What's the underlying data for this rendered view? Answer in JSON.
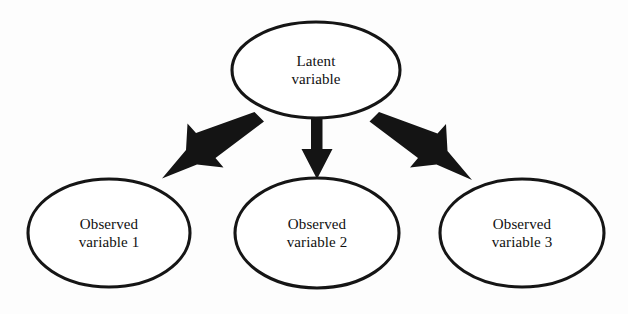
{
  "diagram": {
    "background_color": "#fdfdfd",
    "stroke_color": "#151515",
    "arrow_color": "#141414",
    "text_color": "#101010",
    "nodes": [
      {
        "id": "latent",
        "role": "latent",
        "shape": "ellipse",
        "line1": "Latent",
        "line2": "variable",
        "cx": 316,
        "cy": 70,
        "rx": 84,
        "ry": 48
      },
      {
        "id": "observed1",
        "role": "observed",
        "shape": "ellipse",
        "line1": "Observed",
        "line2": "variable 1",
        "cx": 109,
        "cy": 233,
        "rx": 81,
        "ry": 54
      },
      {
        "id": "observed2",
        "role": "observed",
        "shape": "ellipse",
        "line1": "Observed",
        "line2": "variable 2",
        "cx": 317,
        "cy": 233,
        "rx": 82,
        "ry": 55
      },
      {
        "id": "observed3",
        "role": "observed",
        "shape": "ellipse",
        "line1": "Observed",
        "line2": "variable 3",
        "cx": 522,
        "cy": 233,
        "rx": 82,
        "ry": 54
      }
    ],
    "arrows": [
      {
        "id": "arrow-left",
        "from": "latent",
        "to": "observed1",
        "direction": "down-left",
        "style": "solid-barbed"
      },
      {
        "id": "arrow-center",
        "from": "latent",
        "to": "observed2",
        "direction": "down",
        "style": "solid-barbed"
      },
      {
        "id": "arrow-right",
        "from": "latent",
        "to": "observed3",
        "direction": "down-right",
        "style": "solid-barbed"
      }
    ]
  }
}
